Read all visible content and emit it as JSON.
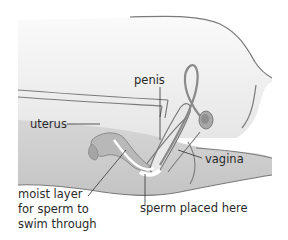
{
  "diagram": {
    "type": "anatomical-cross-section",
    "labels": {
      "penis": "penis",
      "uterus": "uterus",
      "vagina": "vagina",
      "moist_layer_line1": "moist layer",
      "moist_layer_line2": "for sperm to",
      "moist_layer_line3": "swim through",
      "sperm_placed": "sperm placed here"
    },
    "colors": {
      "background": "#ffffff",
      "upper_body": "#f2f2f2",
      "lower_body": "#cfcfcf",
      "outline": "#7a7a7a",
      "organ_fill": "#bdbdbd",
      "highlight": "#ffffff",
      "leader_line": "#333333",
      "text": "#2a2a2a"
    }
  }
}
